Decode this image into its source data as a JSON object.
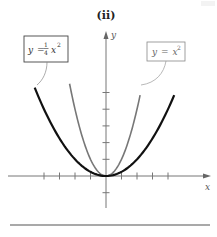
{
  "figure": {
    "title": "(ii)",
    "x_axis_label": "x",
    "y_axis_label": "y",
    "labels": {
      "wide_parabola": {
        "lhs": "y",
        "eq": "=",
        "frac_num": "1",
        "frac_den": "4",
        "var": "x",
        "exp": "2"
      },
      "narrow_parabola": {
        "lhs": "y",
        "eq": "=",
        "var": "x",
        "exp": "2"
      }
    }
  },
  "chart_data": {
    "type": "line",
    "title": "(ii)",
    "xlabel": "x",
    "ylabel": "y",
    "grid": false,
    "legend": "callout boxes",
    "x_ticks": [
      -4,
      -3,
      -2,
      -1,
      1,
      2,
      3,
      4
    ],
    "y_ticks": [
      -1,
      1,
      2,
      3,
      4,
      5
    ],
    "xlim": [
      -6.3,
      6.7
    ],
    "ylim": [
      -1.9,
      8.5
    ],
    "series": [
      {
        "name": "y = (1/4)x^2",
        "color": "#111111",
        "stroke_width": 2.2,
        "function": "0.25*x^2",
        "x_range": [
          -4.6,
          4.4
        ]
      },
      {
        "name": "y = x^2",
        "color": "#777777",
        "stroke_width": 1.6,
        "function": "x^2",
        "x_range": [
          -2.35,
          2.2
        ]
      }
    ],
    "colors": {
      "axis": "#777777",
      "wide": "#111111",
      "narrow": "#777777",
      "rule": "#555555"
    }
  }
}
